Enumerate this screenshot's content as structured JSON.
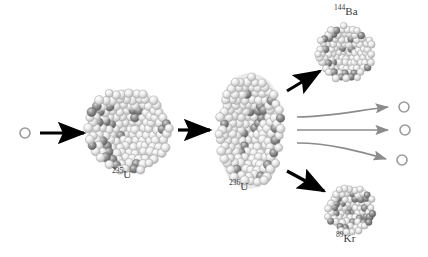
{
  "figure": {
    "background_color": "#ffffff",
    "ink_color": "#000000",
    "secondary_ink_color": "#8c8c8c",
    "label_color": "#3a3a3a"
  },
  "labels": [
    {
      "id": "u235",
      "mass_number": "235",
      "element": "U",
      "text": "235U",
      "x": 112,
      "y": 170
    },
    {
      "id": "u236",
      "mass_number": "236",
      "element": "U",
      "text": "236U",
      "x": 229,
      "y": 182
    },
    {
      "id": "ba144",
      "mass_number": "144",
      "element": "Ba",
      "text": "144Ba",
      "x": 334,
      "y": 6
    },
    {
      "id": "kr89",
      "mass_number": "89",
      "element": "Kr",
      "text": "89Kr",
      "x": 334,
      "y": 233
    }
  ],
  "nuclei": [
    {
      "id": "u235",
      "label": "235U",
      "cx": 128,
      "cy": 130,
      "r": 42,
      "shape": "sphere",
      "nucleon_count": 235
    },
    {
      "id": "u236",
      "label": "236U",
      "cx": 250,
      "cy": 131,
      "rx": 32,
      "ry": 55,
      "shape": "deformed-elongated",
      "nucleon_count": 236
    },
    {
      "id": "ba144",
      "label": "144Ba",
      "cx": 345,
      "cy": 53,
      "r": 28,
      "shape": "sphere",
      "nucleon_count": 144
    },
    {
      "id": "kr89",
      "label": "89Kr",
      "cx": 350,
      "cy": 209,
      "r": 24,
      "shape": "sphere",
      "nucleon_count": 89
    }
  ],
  "neutrons": [
    {
      "id": "incident-neutron",
      "cx": 25,
      "cy": 133,
      "r": 5,
      "role": "incoming"
    },
    {
      "id": "emitted-neutron-1",
      "cx": 404,
      "cy": 107,
      "r": 5,
      "role": "emitted"
    },
    {
      "id": "emitted-neutron-2",
      "cx": 405,
      "cy": 130,
      "r": 5,
      "role": "emitted"
    },
    {
      "id": "emitted-neutron-3",
      "cx": 402,
      "cy": 160,
      "r": 5,
      "role": "emitted"
    }
  ],
  "arrows": [
    {
      "id": "arrow-capture",
      "style": "black-straight",
      "from_x": 40,
      "from_y": 133,
      "to_x": 86,
      "to_y": 133
    },
    {
      "id": "arrow-deform",
      "style": "black-straight",
      "from_x": 178,
      "from_y": 130,
      "to_x": 212,
      "to_y": 130
    },
    {
      "id": "arrow-to-ba144",
      "style": "black-diagonal",
      "from_x": 288,
      "from_y": 90,
      "to_x": 322,
      "to_y": 70
    },
    {
      "id": "arrow-to-kr89",
      "style": "black-diagonal",
      "from_x": 288,
      "from_y": 172,
      "to_x": 326,
      "to_y": 192
    },
    {
      "id": "arrow-neutron-1",
      "style": "gray-curved-up",
      "from_x": 297,
      "from_y": 116,
      "to_x": 392,
      "to_y": 107
    },
    {
      "id": "arrow-neutron-2",
      "style": "gray-straight",
      "from_x": 297,
      "from_y": 130,
      "to_x": 392,
      "to_y": 130
    },
    {
      "id": "arrow-neutron-3",
      "style": "gray-curved-down",
      "from_x": 297,
      "from_y": 144,
      "to_x": 390,
      "to_y": 159
    }
  ]
}
